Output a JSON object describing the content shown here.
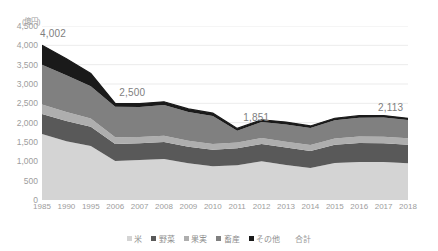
{
  "chart_data": {
    "type": "area",
    "stacked": true,
    "title": "",
    "subtitle": "",
    "xlabel": "",
    "ylabel": "",
    "unit_label": "(億円)",
    "ylim": [
      0,
      4500
    ],
    "ytick_step": 500,
    "ytick_labels": [
      "4,500",
      "4,000",
      "3,500",
      "3,000",
      "2,500",
      "2,000",
      "1,500",
      "1,000",
      "500",
      "0"
    ],
    "ytick_values": [
      4500,
      4000,
      3500,
      3000,
      2500,
      2000,
      1500,
      1000,
      500,
      0
    ],
    "grid": true,
    "grid_axis": "y",
    "legend_position": "bottom",
    "categories": [
      "1985",
      "1990",
      "1995",
      "2006",
      "2007",
      "2008",
      "2009",
      "2010",
      "2011",
      "2012",
      "2013",
      "2014",
      "2015",
      "2016",
      "2017",
      "2018"
    ],
    "series": [
      {
        "name": "米",
        "color": "#d4d4d4",
        "values": [
          1705,
          1520,
          1395,
          1010,
          1035,
          1060,
          950,
          870,
          900,
          1000,
          905,
          830,
          960,
          985,
          985,
          950
        ]
      },
      {
        "name": "野菜",
        "color": "#595959",
        "values": [
          520,
          520,
          500,
          440,
          430,
          440,
          430,
          430,
          440,
          450,
          450,
          440,
          470,
          490,
          480,
          480
        ]
      },
      {
        "name": "果実",
        "color": "#aeaeae",
        "values": [
          245,
          235,
          215,
          170,
          165,
          160,
          155,
          150,
          150,
          155,
          150,
          150,
          160,
          165,
          170,
          170
        ]
      },
      {
        "name": "畜産",
        "color": "#808080",
        "values": [
          1030,
          950,
          830,
          790,
          775,
          795,
          740,
          720,
          300,
          410,
          450,
          440,
          470,
          490,
          500,
          470
        ]
      },
      {
        "name": "その他",
        "color": "#1a1a1a",
        "values": [
          502,
          430,
          330,
          90,
          85,
          85,
          80,
          75,
          61,
          60,
          60,
          55,
          55,
          50,
          48,
          43
        ]
      }
    ],
    "total_label": "合計",
    "totals": [
      4002,
      3655,
      3270,
      2500,
      2490,
      2540,
      2355,
      2245,
      1851,
      2075,
      2015,
      1915,
      2115,
      2180,
      2183,
      2113
    ],
    "annotations": [
      {
        "category": "1985",
        "value": "4,002"
      },
      {
        "category": "2006",
        "value": "2,500"
      },
      {
        "category": "2011",
        "value": "1,851"
      },
      {
        "category": "2018",
        "value": "2,113"
      }
    ]
  },
  "legend": {
    "items": [
      {
        "label": "米",
        "color": "#d4d4d4"
      },
      {
        "label": "野菜",
        "color": "#595959"
      },
      {
        "label": "果実",
        "color": "#aeaeae"
      },
      {
        "label": "畜産",
        "color": "#808080"
      },
      {
        "label": "その他",
        "color": "#1a1a1a"
      }
    ],
    "total_label": "合計"
  }
}
